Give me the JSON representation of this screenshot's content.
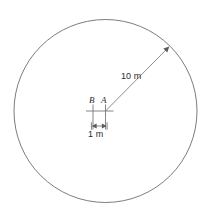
{
  "figure": {
    "background_color": "#ffffff",
    "line_color": "#6d6d6d",
    "text_color": "#2b2b2b",
    "width": 205,
    "height": 220
  },
  "circle": {
    "name": "outer-circle",
    "center_x": 105.5,
    "center_y": 111,
    "radius_px": 91.5,
    "radius_label": "10 m",
    "radius_value": 10,
    "radius_units": "m"
  },
  "points": [
    {
      "id": "B",
      "label": "B",
      "marker": "cross",
      "x": 93,
      "y": 111
    },
    {
      "id": "A",
      "label": "A",
      "marker": "cross",
      "x": 105.5,
      "y": 111
    }
  ],
  "radius_callout": {
    "label": "10 m",
    "from_x": 105.5,
    "from_y": 111,
    "to_x": 169,
    "to_y": 47,
    "arrowhead": "at-circle-edge",
    "label_x": 136,
    "label_y": 78
  },
  "dimension": {
    "label": "1 m",
    "value": 1,
    "units": "m",
    "from_x": 93,
    "from_y": 126,
    "to_x": 105.5,
    "to_y": 126,
    "style": "double-arrow-with-endcaps",
    "label_x": 99,
    "label_y": 136
  }
}
